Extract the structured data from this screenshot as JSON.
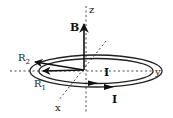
{
  "diagram": {
    "labels": {
      "z_axis": "z",
      "y_axis": "y",
      "x_axis": "x",
      "field": "B",
      "outer_radius": "R",
      "outer_radius_sub": "2",
      "inner_radius": "R",
      "inner_radius_sub": "1",
      "current_inner": "I",
      "current_outer": "I"
    },
    "colors": {
      "ink": "#222222",
      "background": "#ffffff"
    }
  }
}
